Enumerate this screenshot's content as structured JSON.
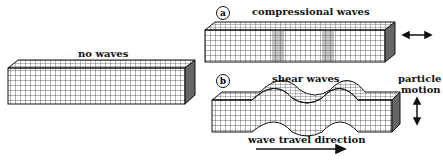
{
  "labels": {
    "no_waves": "no waves",
    "compressional": "compressional waves",
    "shear": "shear waves",
    "particle_motion_1": "particle",
    "particle_motion_2": "motion",
    "wave_travel": "wave travel direction",
    "a": "a",
    "b": "b"
  }
}
